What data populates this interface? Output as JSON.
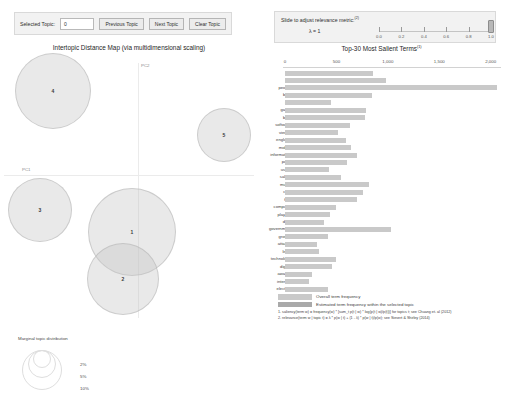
{
  "topic_controls": {
    "selected_topic_label": "Selected Topic:",
    "selected_topic_value": "0",
    "previous_topic_label": "Previous Topic",
    "next_topic_label": "Next Topic",
    "clear_topic_label": "Clear Topic"
  },
  "lambda_controls": {
    "title": "Slide to adjust relevance metric:",
    "title_superscript": "(2)",
    "lambda_label": "λ = 1",
    "slider_value": 1.0,
    "ticks": [
      "0.0",
      "0.2",
      "0.4",
      "0.6",
      "0.8",
      "1.0"
    ]
  },
  "left_panel": {
    "title": "Intertopic Distance Map (via multidimensional scaling)",
    "axis_x_label": "PC1",
    "axis_y_label": "PC2",
    "topics": [
      {
        "id": "4",
        "cx": 53,
        "cy": 36,
        "r": 38
      },
      {
        "id": "5",
        "cx": 224,
        "cy": 80,
        "r": 27
      },
      {
        "id": "3",
        "cx": 40,
        "cy": 155,
        "r": 32
      },
      {
        "id": "1",
        "cx": 132,
        "cy": 177,
        "r": 44
      },
      {
        "id": "2",
        "cx": 123,
        "cy": 224,
        "r": 36
      }
    ],
    "legend": {
      "title": "Marginal topic distribution",
      "percents": [
        "2%",
        "5%",
        "10%"
      ]
    }
  },
  "right_panel": {
    "title": "Top-30 Most Salient Terms",
    "title_superscript": "(1)",
    "x_ticks": [
      "0",
      "500",
      "1,000",
      "1,500",
      "2,000"
    ],
    "x_max": 2100,
    "legend": {
      "overall_label": "Overall term frequency",
      "estimated_label": "Estimated term frequency within the selected topic",
      "overall_color": "#c9c9c9",
      "estimated_color": "#a9a9a9"
    },
    "footnotes": [
      "1. saliency(term w) = frequency(w) * [sum_t p(t | w) * log(p(t | w)/p(t))] for topics t; see Chuang et. al (2012)",
      "2. relevance(term w | topic t) = λ * p(w | t) + (1 - λ) * p(w | t)/p(w); see Sievert & Shirley (2014)"
    ]
  },
  "chart_data": {
    "type": "bar",
    "title": "Top-30 Most Salient Terms",
    "xlabel": "",
    "ylabel": "",
    "xlim": [
      0,
      2100
    ],
    "grid": false,
    "orientation": "horizontal",
    "categories": [
      "file",
      "on",
      "people",
      "best",
      "net",
      "game",
      "blue",
      "software",
      "viewer",
      "england",
      "mobile",
      "information",
      "party",
      "users",
      "salary",
      "music",
      "cost",
      "fine",
      "computer",
      "players",
      "data",
      "government",
      "growth",
      "attacks",
      "lines",
      "technology",
      "digital",
      "awards",
      "internet",
      "election"
    ],
    "values": [
      860,
      980,
      2060,
      850,
      450,
      790,
      780,
      630,
      520,
      590,
      640,
      700,
      600,
      430,
      540,
      820,
      760,
      700,
      500,
      440,
      380,
      1030,
      420,
      310,
      330,
      500,
      460,
      260,
      230,
      420
    ]
  }
}
